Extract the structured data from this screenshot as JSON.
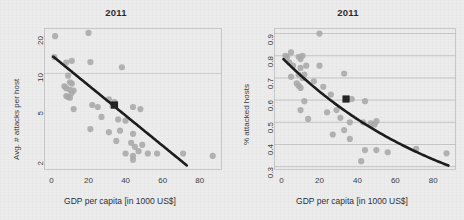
{
  "figure": {
    "background_color": "#ececed",
    "point_color": "#a8a8a8",
    "highlight_color": "#222222",
    "trend_color": "#1a1a1a",
    "grid_color": "#b9b9b9"
  },
  "chart_data": [
    {
      "type": "scatter",
      "panel": "left",
      "title": "2011",
      "xlabel": "GDP per capita [in 1000 US$]",
      "ylabel": "Avg. # attacks per host",
      "xlim": [
        -4,
        92
      ],
      "ylim": [
        1.7,
        23
      ],
      "yscale": "log",
      "xscale": "linear",
      "xticks": [
        0,
        20,
        40,
        60,
        80
      ],
      "yticks": [
        2,
        5,
        10,
        20
      ],
      "grid": "y-only-at-10",
      "legend": "none",
      "points": [
        [
          2,
          19.8
        ],
        [
          1.5,
          13.5
        ],
        [
          8,
          12.2
        ],
        [
          11,
          12.6
        ],
        [
          20,
          21.0
        ],
        [
          21,
          12.3
        ],
        [
          9,
          9.6
        ],
        [
          10,
          8.5
        ],
        [
          11,
          8.3
        ],
        [
          38,
          11.2
        ],
        [
          7,
          7.9
        ],
        [
          8,
          7.6
        ],
        [
          10,
          7.4
        ],
        [
          12,
          7.3
        ],
        [
          11,
          7.0
        ],
        [
          8,
          6.6
        ],
        [
          9,
          6.5
        ],
        [
          10,
          6.4
        ],
        [
          12,
          5.2
        ],
        [
          22,
          5.6
        ],
        [
          25,
          5.4
        ],
        [
          31,
          6.2
        ],
        [
          34,
          5.9
        ],
        [
          33,
          5.5
        ],
        [
          44,
          5.4
        ],
        [
          48,
          5.2
        ],
        [
          27,
          4.5
        ],
        [
          36,
          4.3
        ],
        [
          40,
          4.2
        ],
        [
          21,
          3.6
        ],
        [
          31,
          3.4
        ],
        [
          37,
          3.5
        ],
        [
          44,
          3.3
        ],
        [
          35,
          2.9
        ],
        [
          43,
          2.8
        ],
        [
          45,
          2.6
        ],
        [
          49,
          2.7
        ],
        [
          40,
          2.3
        ],
        [
          44,
          2.2
        ],
        [
          47,
          2.4
        ],
        [
          52,
          2.3
        ],
        [
          57,
          2.3
        ],
        [
          44,
          2.05
        ],
        [
          71,
          2.3
        ],
        [
          87,
          2.2
        ]
      ],
      "highlight_point": [
        34,
        5.6
      ],
      "trend": {
        "shape": "log-linear",
        "x_start": 1,
        "x_end": 73,
        "y_start": 13.6,
        "y_end": 1.85
      }
    },
    {
      "type": "scatter",
      "panel": "right",
      "title": "2011",
      "xlabel": "GDP per capita [in 1000 US$]",
      "ylabel": "% attacked hosts",
      "xlim": [
        -4,
        92
      ],
      "ylim": [
        0.285,
        0.925
      ],
      "yscale": "linear",
      "xscale": "linear",
      "xticks": [
        0,
        20,
        40,
        60,
        80
      ],
      "yticks": [
        0.3,
        0.4,
        0.5,
        0.6,
        0.7,
        0.8,
        0.9
      ],
      "grid": "horizontal",
      "legend": "none",
      "points": [
        [
          20,
          0.9
        ],
        [
          2,
          0.8
        ],
        [
          3,
          0.795
        ],
        [
          5,
          0.815
        ],
        [
          9,
          0.795
        ],
        [
          10,
          0.785
        ],
        [
          11,
          0.8
        ],
        [
          4,
          0.77
        ],
        [
          6,
          0.755
        ],
        [
          10,
          0.745
        ],
        [
          13,
          0.755
        ],
        [
          20,
          0.755
        ],
        [
          5,
          0.705
        ],
        [
          9,
          0.715
        ],
        [
          11,
          0.7
        ],
        [
          12,
          0.715
        ],
        [
          33,
          0.72
        ],
        [
          8,
          0.675
        ],
        [
          9,
          0.665
        ],
        [
          10,
          0.655
        ],
        [
          17,
          0.685
        ],
        [
          22,
          0.66
        ],
        [
          12,
          0.595
        ],
        [
          26,
          0.625
        ],
        [
          37,
          0.605
        ],
        [
          44,
          0.595
        ],
        [
          10,
          0.555
        ],
        [
          24,
          0.545
        ],
        [
          29,
          0.555
        ],
        [
          31,
          0.52
        ],
        [
          14,
          0.515
        ],
        [
          36,
          0.5
        ],
        [
          43,
          0.5
        ],
        [
          47,
          0.495
        ],
        [
          50,
          0.505
        ],
        [
          33,
          0.465
        ],
        [
          49,
          0.49
        ],
        [
          27,
          0.445
        ],
        [
          36,
          0.425
        ],
        [
          44,
          0.375
        ],
        [
          50,
          0.375
        ],
        [
          56,
          0.365
        ],
        [
          71,
          0.38
        ],
        [
          87,
          0.36
        ],
        [
          42,
          0.325
        ]
      ],
      "highlight_point": [
        34,
        0.605
      ],
      "trend": {
        "shape": "exponential-decay",
        "x_start": 1,
        "x_end": 88,
        "y_start": 0.785,
        "y_end": 0.305
      }
    }
  ]
}
